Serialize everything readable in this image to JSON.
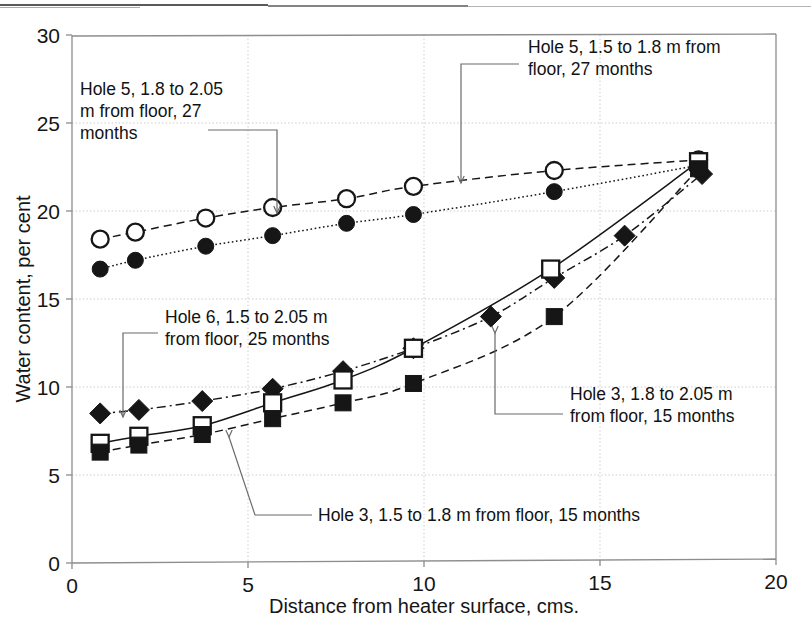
{
  "figure": {
    "kind": "scanned-scientific-figure",
    "background": "#ffffff",
    "ink_color": "#161616",
    "grid_color": "#c9c9c9",
    "frame_color": "#8d8d8d"
  },
  "chart_data": {
    "type": "scatter",
    "title": "",
    "subtitle": "",
    "xlabel": "Distance from heater surface, cms.",
    "ylabel": "Water content, per cent",
    "xlim": [
      0,
      20
    ],
    "ylim": [
      0,
      30
    ],
    "xticks": [
      0,
      5,
      10,
      15,
      20
    ],
    "yticks": [
      0,
      5,
      10,
      15,
      20,
      25,
      30
    ],
    "xtick_labels": [
      "0",
      "5",
      "10",
      "15",
      "20"
    ],
    "ytick_labels": [
      "0",
      "5",
      "10",
      "15",
      "20",
      "25",
      "30"
    ],
    "grid": true,
    "grid_style": "dotted",
    "legend": "none (series identified by leader-line annotations)",
    "series": [
      {
        "name": "Hole 5, 1.5 to 1.8 m from floor, 27 months",
        "marker": "open-circle",
        "line_style": "dashed",
        "color": "#161616",
        "points": [
          {
            "x": 0.8,
            "y": 18.4
          },
          {
            "x": 1.8,
            "y": 18.8
          },
          {
            "x": 3.8,
            "y": 19.6
          },
          {
            "x": 5.7,
            "y": 20.2
          },
          {
            "x": 7.8,
            "y": 20.7
          },
          {
            "x": 9.7,
            "y": 21.4
          },
          {
            "x": 13.7,
            "y": 22.3
          },
          {
            "x": 17.8,
            "y": 22.9
          }
        ]
      },
      {
        "name": "Hole 5, 1.8 to 2.05 m from floor, 27 months",
        "marker": "filled-circle",
        "line_style": "dotted",
        "color": "#161616",
        "points": [
          {
            "x": 0.8,
            "y": 16.7
          },
          {
            "x": 1.8,
            "y": 17.2
          },
          {
            "x": 3.8,
            "y": 18.0
          },
          {
            "x": 5.7,
            "y": 18.6
          },
          {
            "x": 7.8,
            "y": 19.3
          },
          {
            "x": 9.7,
            "y": 19.8
          },
          {
            "x": 13.7,
            "y": 21.1
          },
          {
            "x": 17.8,
            "y": 22.6
          }
        ]
      },
      {
        "name": "Hole 6, 1.5 to 2.05 m from floor, 25 months",
        "marker": "filled-diamond",
        "line_style": "dash-dot",
        "color": "#161616",
        "points": [
          {
            "x": 0.8,
            "y": 8.5
          },
          {
            "x": 1.9,
            "y": 8.7
          },
          {
            "x": 3.7,
            "y": 9.2
          },
          {
            "x": 5.7,
            "y": 9.9
          },
          {
            "x": 7.7,
            "y": 10.9
          },
          {
            "x": 9.7,
            "y": 12.2
          },
          {
            "x": 11.9,
            "y": 14.0
          },
          {
            "x": 13.7,
            "y": 16.2
          },
          {
            "x": 15.7,
            "y": 18.6
          },
          {
            "x": 17.9,
            "y": 22.1
          }
        ]
      },
      {
        "name": "Hole 3, 1.5 to 1.8 m from floor, 15 months",
        "marker": "open-square",
        "line_style": "solid",
        "color": "#161616",
        "points": [
          {
            "x": 0.8,
            "y": 6.8
          },
          {
            "x": 1.9,
            "y": 7.2
          },
          {
            "x": 3.7,
            "y": 7.8
          },
          {
            "x": 5.7,
            "y": 9.1
          },
          {
            "x": 7.7,
            "y": 10.4
          },
          {
            "x": 9.7,
            "y": 12.2
          },
          {
            "x": 13.6,
            "y": 16.7
          },
          {
            "x": 17.8,
            "y": 22.8
          }
        ]
      },
      {
        "name": "Hole 3, 1.8 to 2.05 m from floor, 15 months",
        "marker": "filled-square",
        "line_style": "dashed",
        "color": "#161616",
        "points": [
          {
            "x": 0.8,
            "y": 6.3
          },
          {
            "x": 1.9,
            "y": 6.7
          },
          {
            "x": 3.7,
            "y": 7.3
          },
          {
            "x": 5.7,
            "y": 8.2
          },
          {
            "x": 7.7,
            "y": 9.1
          },
          {
            "x": 9.7,
            "y": 10.2
          },
          {
            "x": 13.7,
            "y": 14.0
          },
          {
            "x": 17.8,
            "y": 22.4
          }
        ]
      }
    ],
    "annotations": [
      {
        "id": "annot-hole5-18-205",
        "text_lines": [
          "Hole 5, 1.8 to 2.05",
          "m from floor, 27",
          "months"
        ],
        "text_x": 80,
        "text_y": 95,
        "leader": "M 208 130 L 277 130 L 277 213",
        "arrow_at": [
          277,
          213
        ]
      },
      {
        "id": "annot-hole5-15-18",
        "text_lines": [
          "Hole 5, 1.5 to 1.8 m from",
          "floor, 27 months"
        ],
        "text_x": 528,
        "text_y": 53,
        "leader": "M 519 64 L 461 64 L 461 183",
        "arrow_at": [
          461,
          183
        ]
      },
      {
        "id": "annot-hole6",
        "text_lines": [
          "Hole 6, 1.5 to 2.05 m",
          "from floor, 25 months"
        ],
        "text_x": 165,
        "text_y": 323,
        "leader": "M 158 333 L 123 333 L 123 417",
        "arrow_at": [
          123,
          417
        ]
      },
      {
        "id": "annot-hole3-18-205",
        "text_lines": [
          "Hole 3, 1.8 to 2.05 m",
          "from floor, 15 months"
        ],
        "text_x": 570,
        "text_y": 400,
        "leader": "M 563 414 L 495 414 L 495 333",
        "arrow_at": [
          495,
          333
        ]
      },
      {
        "id": "annot-hole3-15-18",
        "text_lines": [
          "Hole 3, 1.5 to 1.8 m from floor, 15 months"
        ],
        "text_x": 318,
        "text_y": 521,
        "leader": "M 312 515 L 255 515 L 229 437",
        "arrow_at": [
          229,
          437
        ]
      }
    ]
  }
}
